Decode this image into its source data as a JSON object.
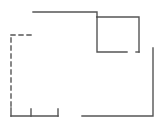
{
  "diagram": {
    "type": "floor-plan",
    "stroke_color": "#555555",
    "background": "#ffffff",
    "walls": [
      {
        "id": "top-wall",
        "style": "solid",
        "points": [
          [
            33,
            12
          ],
          [
            97,
            12
          ],
          [
            97,
            17
          ]
        ]
      },
      {
        "id": "inner-box-top",
        "style": "solid",
        "points": [
          [
            97,
            17
          ],
          [
            139,
            17
          ],
          [
            139,
            52
          ]
        ]
      },
      {
        "id": "inner-box-left",
        "style": "solid",
        "points": [
          [
            97,
            17
          ],
          [
            97,
            52
          ],
          [
            127,
            52
          ]
        ]
      },
      {
        "id": "inner-box-stub",
        "style": "solid",
        "points": [
          [
            136,
            52
          ],
          [
            139,
            52
          ]
        ]
      },
      {
        "id": "right-wall",
        "style": "solid",
        "points": [
          [
            153,
            48
          ],
          [
            153,
            116
          ],
          [
            82,
            116
          ]
        ]
      },
      {
        "id": "bottom-left-wall",
        "style": "solid",
        "points": [
          [
            11,
            116
          ],
          [
            58,
            116
          ]
        ]
      },
      {
        "id": "tick-1",
        "style": "solid",
        "points": [
          [
            11,
            108
          ],
          [
            11,
            116
          ]
        ]
      },
      {
        "id": "tick-2",
        "style": "solid",
        "points": [
          [
            31,
            109
          ],
          [
            31,
            116
          ]
        ]
      },
      {
        "id": "tick-3",
        "style": "solid",
        "points": [
          [
            58,
            109
          ],
          [
            58,
            116
          ]
        ]
      },
      {
        "id": "dashed-left-wall",
        "style": "dashed",
        "points": [
          [
            11,
            106
          ],
          [
            11,
            35
          ]
        ]
      },
      {
        "id": "dashed-top-wall",
        "style": "dashed",
        "points": [
          [
            11,
            35
          ],
          [
            32,
            35
          ]
        ]
      }
    ]
  }
}
